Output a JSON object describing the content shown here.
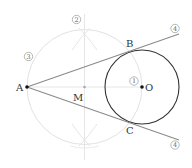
{
  "diagram": {
    "title": "",
    "colors": {
      "construction": "#dddddd",
      "circle_o": "#333333",
      "tangent": "#888888",
      "point": "#111111",
      "midpoint": "#aaaaaa"
    },
    "points": {
      "A": {
        "label": "A",
        "x": 27,
        "y": 87
      },
      "M": {
        "label": "M",
        "x": 84.5,
        "y": 87
      },
      "O": {
        "label": "O",
        "x": 142,
        "y": 87
      },
      "B": {
        "label": "B",
        "x": 130,
        "y": 52
      },
      "C": {
        "label": "C",
        "x": 130,
        "y": 122
      }
    },
    "circles": {
      "circle_o": {
        "cx": 142,
        "cy": 87,
        "r": 37
      },
      "circle_m": {
        "cx": 84.5,
        "cy": 87,
        "r": 57.5
      }
    },
    "step_markers": {
      "step1": "1",
      "step2": "2",
      "step3": "3",
      "step4_top": "4",
      "step4_bottom": "4"
    }
  }
}
